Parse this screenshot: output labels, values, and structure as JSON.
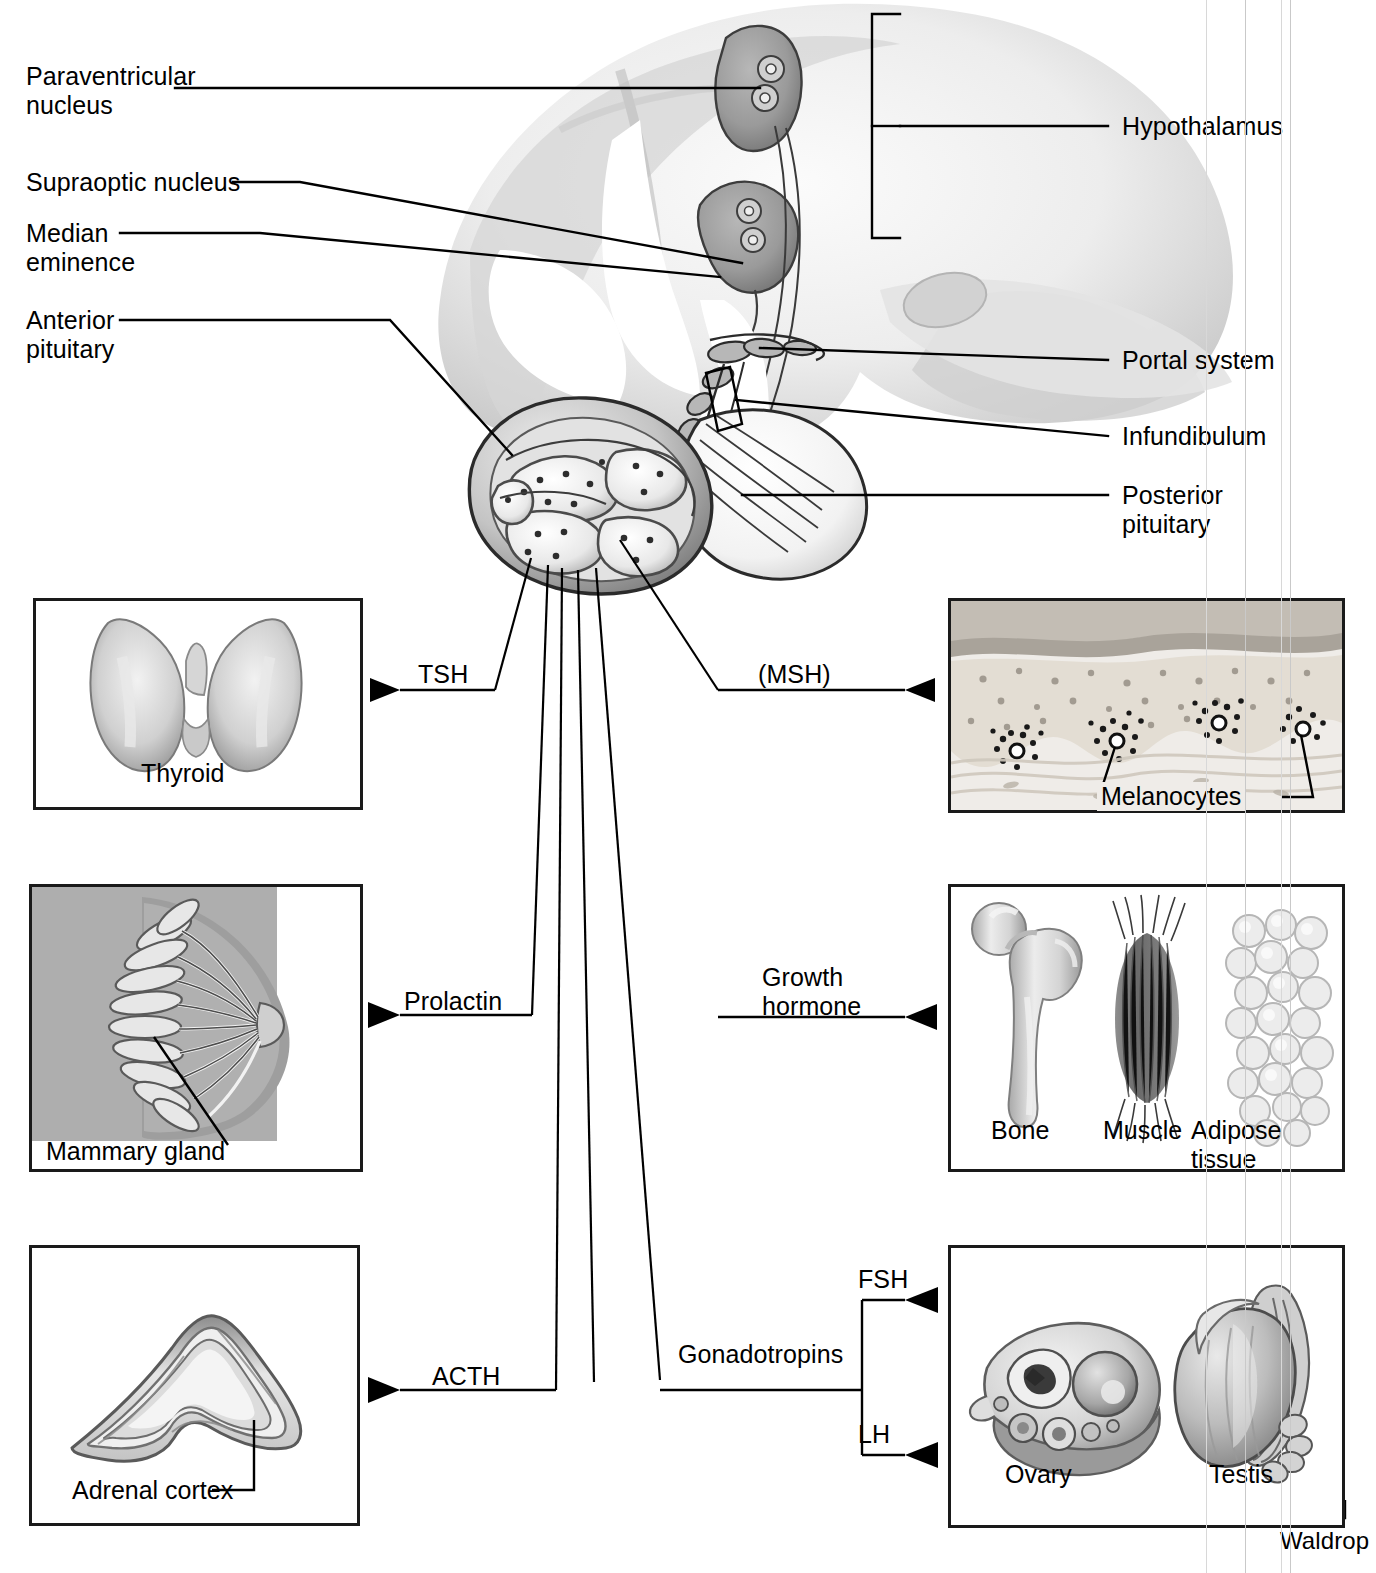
{
  "figure": {
    "artist_signature": "Waldrop"
  },
  "labels_left": [
    {
      "id": "paraventricular-nucleus",
      "text": "Paraventricular\nnucleus"
    },
    {
      "id": "supraoptic-nucleus",
      "text": "Supraoptic nucleus"
    },
    {
      "id": "median-eminence",
      "text": "Median\neminence"
    },
    {
      "id": "anterior-pituitary",
      "text": "Anterior\npituitary"
    }
  ],
  "labels_right": [
    {
      "id": "hypothalamus",
      "text": "Hypothalamus"
    },
    {
      "id": "portal-system",
      "text": "Portal system"
    },
    {
      "id": "infundibulum",
      "text": "Infundibulum"
    },
    {
      "id": "posterior-pituitary",
      "text": "Posterior\npituitary"
    }
  ],
  "hormones": [
    {
      "id": "tsh",
      "text": "TSH"
    },
    {
      "id": "msh",
      "text": "(MSH)"
    },
    {
      "id": "prolactin",
      "text": "Prolactin"
    },
    {
      "id": "growth-hormone",
      "text": "Growth\nhormone"
    },
    {
      "id": "acth",
      "text": "ACTH"
    },
    {
      "id": "gonadotropins",
      "text": "Gonadotropins"
    },
    {
      "id": "fsh",
      "text": "FSH"
    },
    {
      "id": "lh",
      "text": "LH"
    }
  ],
  "panels": {
    "thyroid": {
      "caption": "Thyroid"
    },
    "skin": {
      "caption": "Melanocytes"
    },
    "breast": {
      "caption": "Mammary gland"
    },
    "tissues": {
      "captions": [
        "Bone",
        "Muscle",
        "Adipose tissue"
      ]
    },
    "adrenal": {
      "caption": "Adrenal cortex"
    },
    "gonads": {
      "captions": [
        "Ovary",
        "Testis"
      ]
    }
  },
  "colors": {
    "ink": "#000000",
    "box_border": "#1a1a1a",
    "tissue_mid": "#9a9a9a",
    "tissue_dark": "#5f5f5f",
    "tissue_light": "#d8d8d8",
    "scan_artifact": "#d8d8d8"
  }
}
